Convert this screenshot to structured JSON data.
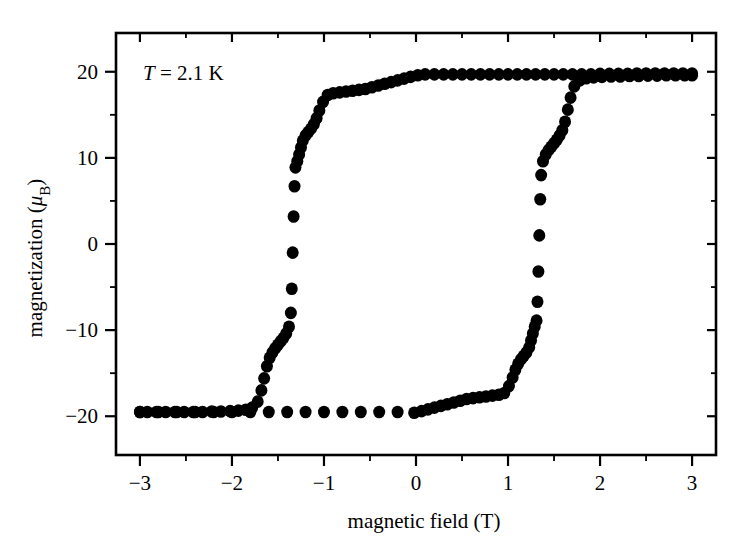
{
  "chart_data": {
    "type": "scatter",
    "title": "",
    "xlabel": "magnetic field (T)",
    "ylabel": "magnetization (μB)",
    "ylabel_main": "magnetization (",
    "ylabel_mu": "μ",
    "ylabel_sub": "B",
    "ylabel_close": ")",
    "annotation": "T = 2.1 K",
    "annotation_var": "T",
    "annotation_rest": " = 2.1 K",
    "xlim": [
      -3.26,
      3.26
    ],
    "ylim": [
      -24.5,
      24.5
    ],
    "xticks": [
      -3,
      -2,
      -1,
      0,
      1,
      2,
      3
    ],
    "xticklabels": [
      "−3",
      "−2",
      "−1",
      "0",
      "1",
      "2",
      "3"
    ],
    "xminorticks": [
      -2.5,
      -1.5,
      -0.5,
      0.5,
      1.5,
      2.5
    ],
    "yticks": [
      -20,
      -10,
      0,
      10,
      20
    ],
    "yticklabels": [
      "−20",
      "−10",
      "0",
      "10",
      "20"
    ],
    "yminorticks": [
      -15,
      -5,
      5,
      15
    ],
    "grid": false,
    "legend": "none",
    "marker": "filled-circle",
    "marker_color": "#000000",
    "marker_radius_px": 6.0,
    "series": [
      {
        "name": "descending branch (field swept from +3 T to −3 T)",
        "points": [
          [
            3.0,
            19.8
          ],
          [
            2.9,
            19.8
          ],
          [
            2.8,
            19.8
          ],
          [
            2.7,
            19.8
          ],
          [
            2.6,
            19.8
          ],
          [
            2.5,
            19.8
          ],
          [
            2.4,
            19.8
          ],
          [
            2.3,
            19.75
          ],
          [
            2.2,
            19.75
          ],
          [
            2.1,
            19.75
          ],
          [
            2.0,
            19.75
          ],
          [
            1.9,
            19.7
          ],
          [
            1.8,
            19.7
          ],
          [
            1.7,
            19.7
          ],
          [
            1.6,
            19.7
          ],
          [
            1.5,
            19.7
          ],
          [
            1.4,
            19.7
          ],
          [
            1.3,
            19.7
          ],
          [
            1.2,
            19.7
          ],
          [
            1.1,
            19.7
          ],
          [
            1.0,
            19.7
          ],
          [
            0.9,
            19.7
          ],
          [
            0.8,
            19.7
          ],
          [
            0.7,
            19.7
          ],
          [
            0.6,
            19.7
          ],
          [
            0.5,
            19.7
          ],
          [
            0.4,
            19.7
          ],
          [
            0.3,
            19.7
          ],
          [
            0.2,
            19.7
          ],
          [
            0.1,
            19.7
          ],
          [
            0.02,
            19.6
          ],
          [
            -0.06,
            19.4
          ],
          [
            -0.13,
            19.2
          ],
          [
            -0.2,
            19.0
          ],
          [
            -0.27,
            18.8
          ],
          [
            -0.34,
            18.6
          ],
          [
            -0.41,
            18.4
          ],
          [
            -0.48,
            18.2
          ],
          [
            -0.55,
            18.0
          ],
          [
            -0.62,
            17.9
          ],
          [
            -0.69,
            17.8
          ],
          [
            -0.76,
            17.7
          ],
          [
            -0.83,
            17.6
          ],
          [
            -0.9,
            17.5
          ],
          [
            -0.96,
            17.3
          ],
          [
            -1.01,
            16.5
          ],
          [
            -1.05,
            15.5
          ],
          [
            -1.08,
            14.6
          ],
          [
            -1.11,
            13.9
          ],
          [
            -1.14,
            13.4
          ],
          [
            -1.17,
            13.0
          ],
          [
            -1.2,
            12.6
          ],
          [
            -1.23,
            12.0
          ],
          [
            -1.25,
            11.2
          ],
          [
            -1.27,
            10.4
          ],
          [
            -1.29,
            9.6
          ],
          [
            -1.31,
            8.9
          ],
          [
            -1.32,
            6.7
          ],
          [
            -1.33,
            3.2
          ],
          [
            -1.34,
            -1.0
          ],
          [
            -1.35,
            -5.2
          ],
          [
            -1.36,
            -8.0
          ],
          [
            -1.38,
            -9.6
          ],
          [
            -1.41,
            -10.4
          ],
          [
            -1.44,
            -10.9
          ],
          [
            -1.47,
            -11.3
          ],
          [
            -1.5,
            -11.7
          ],
          [
            -1.53,
            -12.1
          ],
          [
            -1.56,
            -12.6
          ],
          [
            -1.59,
            -13.2
          ],
          [
            -1.62,
            -14.2
          ],
          [
            -1.65,
            -15.6
          ],
          [
            -1.68,
            -17.0
          ],
          [
            -1.72,
            -18.3
          ],
          [
            -1.78,
            -19.0
          ],
          [
            -1.85,
            -19.25
          ],
          [
            -1.93,
            -19.35
          ],
          [
            -2.02,
            -19.4
          ],
          [
            -2.12,
            -19.45
          ],
          [
            -2.22,
            -19.45
          ],
          [
            -2.32,
            -19.5
          ],
          [
            -2.42,
            -19.5
          ],
          [
            -2.52,
            -19.5
          ],
          [
            -2.62,
            -19.5
          ],
          [
            -2.72,
            -19.5
          ],
          [
            -2.82,
            -19.5
          ],
          [
            -2.92,
            -19.5
          ],
          [
            -3.0,
            -19.5
          ]
        ]
      },
      {
        "name": "ascending branch (field swept from −3 T to +3 T)",
        "points": [
          [
            -3.0,
            -19.5
          ],
          [
            -2.8,
            -19.5
          ],
          [
            -2.6,
            -19.5
          ],
          [
            -2.4,
            -19.5
          ],
          [
            -2.2,
            -19.5
          ],
          [
            -2.0,
            -19.5
          ],
          [
            -1.8,
            -19.5
          ],
          [
            -1.6,
            -19.5
          ],
          [
            -1.4,
            -19.5
          ],
          [
            -1.2,
            -19.5
          ],
          [
            -1.0,
            -19.5
          ],
          [
            -0.8,
            -19.5
          ],
          [
            -0.6,
            -19.5
          ],
          [
            -0.4,
            -19.5
          ],
          [
            -0.2,
            -19.5
          ],
          [
            -0.02,
            -19.6
          ],
          [
            0.06,
            -19.4
          ],
          [
            0.13,
            -19.2
          ],
          [
            0.2,
            -19.0
          ],
          [
            0.27,
            -18.8
          ],
          [
            0.34,
            -18.6
          ],
          [
            0.41,
            -18.4
          ],
          [
            0.48,
            -18.2
          ],
          [
            0.55,
            -18.0
          ],
          [
            0.62,
            -17.9
          ],
          [
            0.69,
            -17.8
          ],
          [
            0.76,
            -17.7
          ],
          [
            0.83,
            -17.6
          ],
          [
            0.9,
            -17.5
          ],
          [
            0.96,
            -17.3
          ],
          [
            1.01,
            -16.5
          ],
          [
            1.05,
            -15.5
          ],
          [
            1.08,
            -14.6
          ],
          [
            1.11,
            -13.9
          ],
          [
            1.14,
            -13.4
          ],
          [
            1.17,
            -13.0
          ],
          [
            1.2,
            -12.6
          ],
          [
            1.23,
            -12.0
          ],
          [
            1.25,
            -11.2
          ],
          [
            1.27,
            -10.4
          ],
          [
            1.29,
            -9.6
          ],
          [
            1.31,
            -8.9
          ],
          [
            1.32,
            -6.7
          ],
          [
            1.33,
            -3.2
          ],
          [
            1.34,
            1.0
          ],
          [
            1.35,
            5.2
          ],
          [
            1.36,
            8.0
          ],
          [
            1.38,
            9.6
          ],
          [
            1.41,
            10.4
          ],
          [
            1.44,
            10.9
          ],
          [
            1.47,
            11.3
          ],
          [
            1.5,
            11.7
          ],
          [
            1.53,
            12.1
          ],
          [
            1.56,
            12.6
          ],
          [
            1.59,
            13.2
          ],
          [
            1.62,
            14.2
          ],
          [
            1.65,
            15.6
          ],
          [
            1.68,
            17.0
          ],
          [
            1.72,
            18.3
          ],
          [
            1.78,
            19.0
          ],
          [
            1.85,
            19.25
          ],
          [
            1.93,
            19.35
          ],
          [
            2.02,
            19.4
          ],
          [
            2.12,
            19.45
          ],
          [
            2.22,
            19.45
          ],
          [
            2.32,
            19.5
          ],
          [
            2.42,
            19.5
          ],
          [
            2.52,
            19.55
          ],
          [
            2.62,
            19.55
          ],
          [
            2.72,
            19.6
          ],
          [
            2.82,
            19.6
          ],
          [
            2.92,
            19.6
          ],
          [
            3.0,
            19.6
          ]
        ]
      }
    ]
  }
}
